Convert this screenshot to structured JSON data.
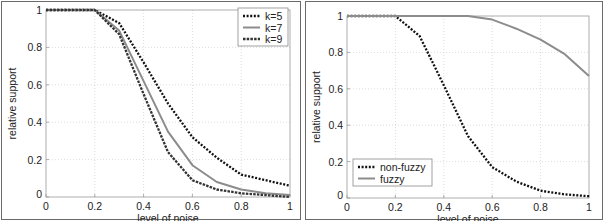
{
  "chart_data": [
    {
      "type": "line",
      "title": "",
      "xlabel": "level of noise",
      "ylabel": "relative support",
      "xlim": [
        0,
        1
      ],
      "ylim": [
        0,
        1
      ],
      "xticks": [
        "0",
        "0.2",
        "0.4",
        "0.6",
        "0.8",
        "1"
      ],
      "yticks": [
        "0",
        "0.2",
        "0.4",
        "0.6",
        "0.8",
        "1"
      ],
      "grid": true,
      "legend_position": "upper right",
      "x": [
        0,
        0.1,
        0.2,
        0.3,
        0.4,
        0.5,
        0.6,
        0.7,
        0.8,
        0.9,
        1.0
      ],
      "series": [
        {
          "name": "k=5",
          "style": "dotted",
          "color": "#111111",
          "values": [
            1,
            1,
            1,
            0.93,
            0.72,
            0.5,
            0.32,
            0.21,
            0.12,
            0.09,
            0.06
          ]
        },
        {
          "name": "k=7",
          "style": "solid",
          "color": "#8c8c8c",
          "values": [
            1,
            1,
            1,
            0.89,
            0.62,
            0.35,
            0.17,
            0.08,
            0.04,
            0.02,
            0.01
          ]
        },
        {
          "name": "k=9",
          "style": "dashed",
          "color": "#333333",
          "values": [
            1,
            1,
            1,
            0.87,
            0.55,
            0.24,
            0.09,
            0.04,
            0.02,
            0.01,
            0.0
          ]
        }
      ]
    },
    {
      "type": "line",
      "title": "",
      "xlabel": "level of noise",
      "ylabel": "relative support",
      "xlim": [
        0,
        1
      ],
      "ylim": [
        0,
        1
      ],
      "xticks": [
        "0",
        "0.2",
        "0.4",
        "0.6",
        "0.8",
        "1"
      ],
      "yticks": [
        "0",
        "0.2",
        "0.4",
        "0.6",
        "0.8",
        "1"
      ],
      "grid": true,
      "legend_position": "lower left",
      "x": [
        0,
        0.1,
        0.2,
        0.3,
        0.4,
        0.5,
        0.6,
        0.7,
        0.8,
        0.9,
        1.0
      ],
      "series": [
        {
          "name": "non-fuzzy",
          "style": "dotted",
          "color": "#111111",
          "values": [
            1,
            1,
            1,
            0.89,
            0.62,
            0.34,
            0.17,
            0.09,
            0.04,
            0.02,
            0.01
          ]
        },
        {
          "name": "fuzzy",
          "style": "solid",
          "color": "#8c8c8c",
          "values": [
            1,
            1,
            1,
            1,
            1,
            1,
            0.98,
            0.93,
            0.87,
            0.79,
            0.67
          ]
        }
      ]
    }
  ]
}
